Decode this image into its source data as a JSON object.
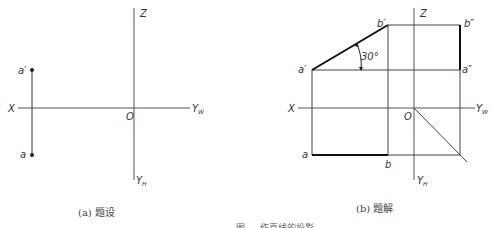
{
  "diagram": {
    "type": "orthographic-projection",
    "panels": [
      {
        "id": "a",
        "caption": "(a) 题设",
        "axes": {
          "x": "X",
          "z": "Z",
          "origin": "O",
          "yw": "Y",
          "yw_sub": "W",
          "yh": "Y",
          "yh_sub": "H"
        },
        "points": [
          {
            "label": "a′",
            "role": "front-view"
          },
          {
            "label": "a",
            "role": "top-view"
          }
        ]
      },
      {
        "id": "b",
        "caption": "(b) 题解",
        "axes": {
          "x": "X",
          "z": "Z",
          "origin": "O",
          "yw": "Y",
          "yw_sub": "W",
          "yh": "Y",
          "yh_sub": "H"
        },
        "points": [
          {
            "label": "a′"
          },
          {
            "label": "b′"
          },
          {
            "label": "b″"
          },
          {
            "label": "a″"
          },
          {
            "label": "a"
          },
          {
            "label": "b"
          }
        ],
        "angle_label": "30°"
      }
    ],
    "figure_caption": "图 … 作直线的投影"
  }
}
